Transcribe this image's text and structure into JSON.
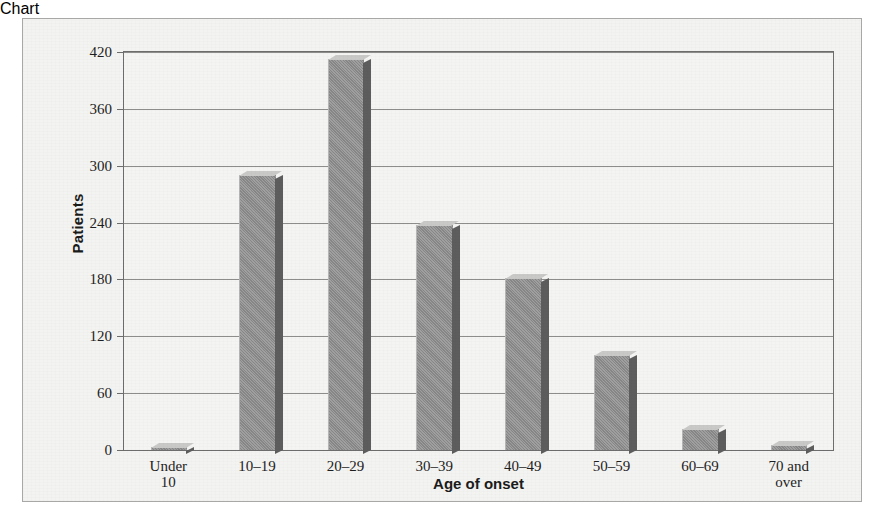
{
  "chart_data": {
    "type": "bar",
    "title": "",
    "xlabel": "Age of onset",
    "ylabel": "Patients",
    "categories": [
      "Under 10",
      "10–19",
      "20–29",
      "30–39",
      "40–49",
      "50–59",
      "60–69",
      "70 and\nover"
    ],
    "values": [
      3,
      290,
      413,
      237,
      182,
      100,
      22,
      5
    ],
    "ylim": [
      0,
      420
    ],
    "yticks": [
      0,
      60,
      120,
      180,
      240,
      300,
      360,
      420
    ],
    "ytick_labels": [
      "0",
      "60",
      "120",
      "180",
      "240",
      "300",
      "360",
      "420"
    ],
    "grid": true,
    "legend": false,
    "bar_style": "3d-shaded",
    "colors": {
      "bar_face": "#8e8e8e",
      "bar_side": "#5d5d5d",
      "bar_top": "#c9c9c7",
      "plot_background": "#f4f4f2",
      "panel_background": "#f3f3f1",
      "axis_line": "#6d6d6d",
      "gridline": "#8d8d8b",
      "text": "#1e1e1e"
    }
  }
}
